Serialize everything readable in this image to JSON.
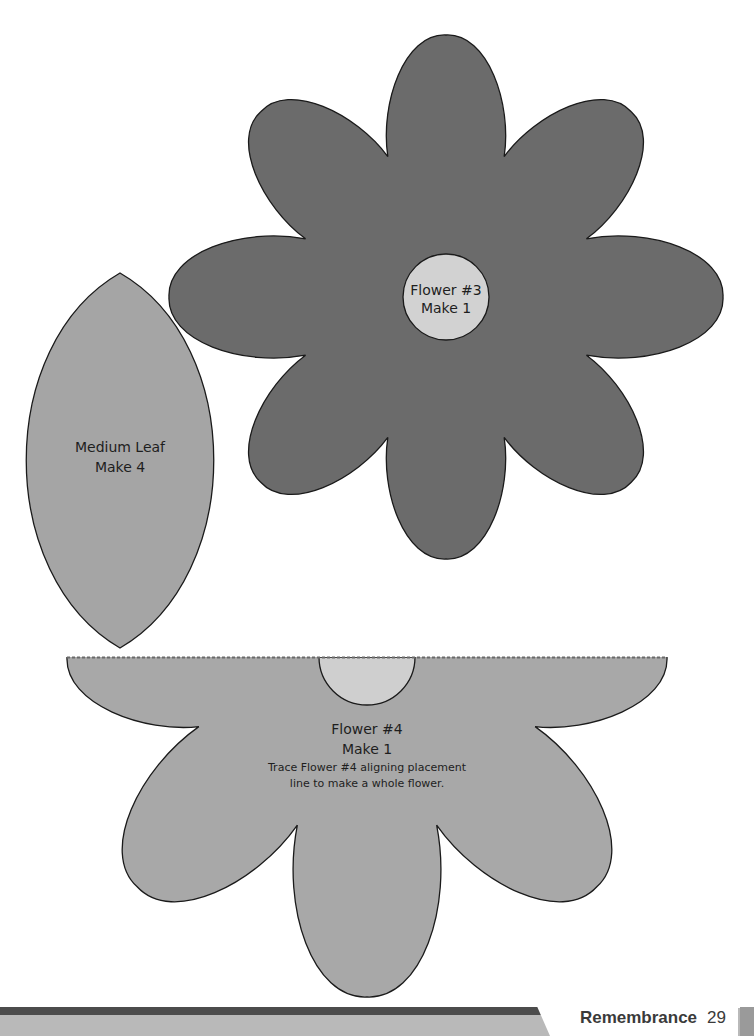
{
  "pieces": {
    "flower3": {
      "name": "Flower #3",
      "qty": "Make 1",
      "fill": "#6b6b6b",
      "center_fill": "#d2d2d2"
    },
    "medium_leaf": {
      "name": "Medium Leaf",
      "qty": "Make 4",
      "fill": "#a5a5a5"
    },
    "flower4": {
      "name": "Flower #4",
      "qty": "Make 1",
      "instruction_line1": "Trace Flower #4 aligning placement",
      "instruction_line2": "line to make a whole flower.",
      "fill": "#a8a8a8",
      "center_fill": "#cfcfcf"
    }
  },
  "footer": {
    "title": "Remembrance",
    "page": "29"
  }
}
